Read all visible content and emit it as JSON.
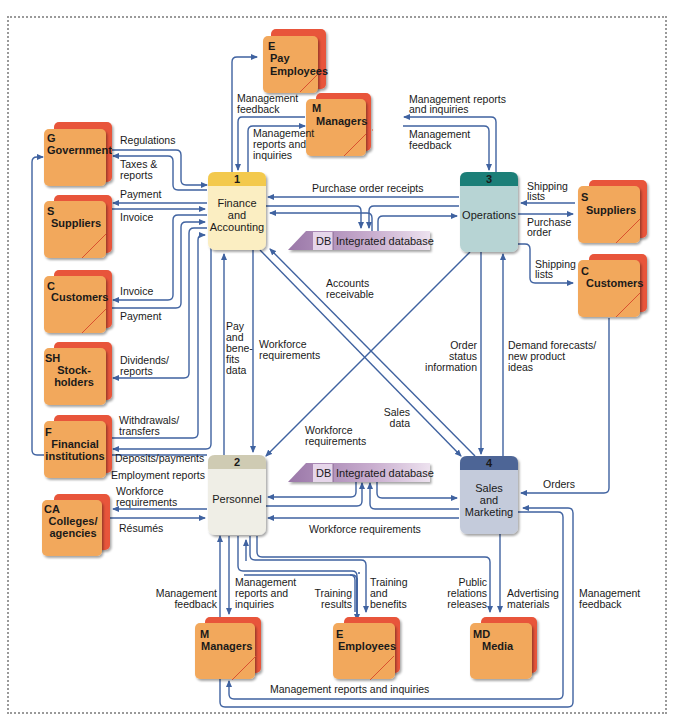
{
  "colors": {
    "flow": "#3f62a0",
    "entity_front": "#f2a85c",
    "entity_back": "#e8553a",
    "db_fill": "#b996c0",
    "finance_header": "#f3c94e",
    "finance_body": "#fbeec2",
    "personnel_header": "#cfcbb3",
    "personnel_body": "#efeee6",
    "operations_header": "#1f7f78",
    "operations_body": "#b7d4d4",
    "sales_header": "#4d6596",
    "sales_body": "#c4cbdb"
  },
  "processes": [
    {
      "num": "1",
      "lines": [
        "Finance",
        "and",
        "Accounting"
      ]
    },
    {
      "num": "2",
      "lines": [
        "Personnel"
      ]
    },
    {
      "num": "3",
      "lines": [
        "Operations"
      ]
    },
    {
      "num": "4",
      "lines": [
        "Sales",
        "and",
        "Marketing"
      ]
    }
  ],
  "datastores": [
    {
      "id": "DB",
      "name": "Integrated database"
    },
    {
      "id": "DB",
      "name": "Integrated database"
    }
  ],
  "entities": {
    "pay_employees": {
      "id": "E",
      "lines": [
        "Pay",
        "Employees"
      ]
    },
    "managers_top": {
      "id": "M",
      "lines": [
        "Managers"
      ]
    },
    "government": {
      "id": "G",
      "lines": [
        "Government"
      ]
    },
    "suppliers_left": {
      "id": "S",
      "lines": [
        "Suppliers"
      ]
    },
    "customers_left": {
      "id": "C",
      "lines": [
        "Customers"
      ]
    },
    "stockholders": {
      "id": "SH",
      "lines": [
        "Stock-",
        "holders"
      ]
    },
    "financial": {
      "id": "F",
      "lines": [
        "Financial",
        "institutions"
      ]
    },
    "colleges": {
      "id": "CA",
      "lines": [
        "Colleges/",
        "agencies"
      ]
    },
    "suppliers_right": {
      "id": "S",
      "lines": [
        "Suppliers"
      ]
    },
    "customers_right": {
      "id": "C",
      "lines": [
        "Customers"
      ]
    },
    "managers_bottom": {
      "id": "M",
      "lines": [
        "Managers"
      ]
    },
    "employees": {
      "id": "E",
      "lines": [
        "Employees"
      ]
    },
    "media": {
      "id": "MD",
      "lines": [
        "Media"
      ]
    }
  },
  "flows": {
    "mgmt_feedback_top": [
      "Management",
      "feedback"
    ],
    "mgmt_reports_fin": [
      "Management",
      "reports and",
      "inquiries"
    ],
    "mgmt_reports_ops": [
      "Management reports",
      "and inquiries"
    ],
    "mgmt_feedback_ops": [
      "Management",
      "feedback"
    ],
    "regulations": [
      "Regulations"
    ],
    "taxes": [
      "Taxes &",
      "reports"
    ],
    "payment_sup": [
      "Payment"
    ],
    "invoice_sup": [
      "Invoice"
    ],
    "invoice_cust": [
      "Invoice"
    ],
    "payment_cust": [
      "Payment"
    ],
    "dividends": [
      "Dividends/",
      "reports"
    ],
    "withdrawals": [
      "Withdrawals/",
      "transfers"
    ],
    "deposits": [
      "Deposits/payments"
    ],
    "employment_reports": [
      "Employment reports"
    ],
    "workforce_col": [
      "Workforce",
      "requirements"
    ],
    "resumes": [
      "Résumés"
    ],
    "purchase_receipts": [
      "Purchase order receipts"
    ],
    "shipping_sup": [
      "Shipping",
      "lists"
    ],
    "purchase_order": [
      "Purchase",
      "order"
    ],
    "shipping_cust": [
      "Shipping",
      "lists"
    ],
    "accounts_receivable": [
      "Accounts",
      "receivable"
    ],
    "pay_benefits": [
      "Pay",
      "and",
      "bene-",
      "fits",
      "data"
    ],
    "workforce_fin": [
      "Workforce",
      "requirements"
    ],
    "order_status": [
      "Order",
      "status",
      "information"
    ],
    "demand": [
      "Demand forecasts/",
      "new product",
      "ideas"
    ],
    "sales_data": [
      "Sales",
      "data"
    ],
    "workforce_ops": [
      "Workforce",
      "requirements"
    ],
    "orders": [
      "Orders"
    ],
    "workforce_sales": [
      "Workforce requirements"
    ],
    "mgmt_feedback_bot": [
      "Management",
      "feedback"
    ],
    "mgmt_reports_bot": [
      "Management",
      "reports and",
      "inquiries"
    ],
    "training_results": [
      "Training",
      "results"
    ],
    "training_benefits": [
      "Training",
      "and",
      "benefits"
    ],
    "public_relations": [
      "Public",
      "relations",
      "releases"
    ],
    "advertising": [
      "Advertising",
      "materials"
    ],
    "mgmt_feedback_sales": [
      "Management",
      "feedback"
    ],
    "mgmt_reports_bottom": [
      "Management reports and inquiries"
    ]
  }
}
